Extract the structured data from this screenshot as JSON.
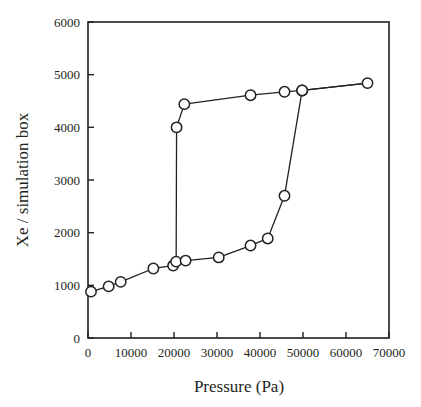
{
  "figure": {
    "background_color": "#ffffff",
    "ink_color": "#231f20",
    "marker_fill_color": "#ffffff"
  },
  "chart_data": {
    "type": "line",
    "title": "",
    "subtitle": "",
    "xlabel": "Pressure (Pa)",
    "ylabel": "Xe / simulation box",
    "xlim": [
      0,
      70000
    ],
    "ylim": [
      0,
      6000
    ],
    "xticks": [
      0,
      10000,
      20000,
      30000,
      40000,
      50000,
      60000,
      70000
    ],
    "yticks": [
      0,
      1000,
      2000,
      3000,
      4000,
      5000,
      6000
    ],
    "xtick_labels": [
      "0",
      "10000",
      "20000",
      "30000",
      "40000",
      "50000",
      "60000",
      "70000"
    ],
    "ytick_labels": [
      "0",
      "1000",
      "2000",
      "3000",
      "4000",
      "5000",
      "6000"
    ],
    "grid": false,
    "legend": false,
    "legend_position": "none",
    "marker": "open-circle",
    "series": [
      {
        "name": "adsorption",
        "x": [
          700,
          4800,
          7600,
          15200,
          19800,
          20500,
          20600,
          22400,
          37800,
          45700,
          49800,
          65000
        ],
        "y": [
          880,
          980,
          1065,
          1320,
          1375,
          1450,
          4000,
          4440,
          4610,
          4675,
          4700,
          4840
        ]
      },
      {
        "name": "desorption",
        "x": [
          22700,
          30400,
          37800,
          41800,
          45700,
          49800
        ],
        "y": [
          1470,
          1530,
          1755,
          1890,
          2700,
          4700
        ]
      }
    ]
  }
}
